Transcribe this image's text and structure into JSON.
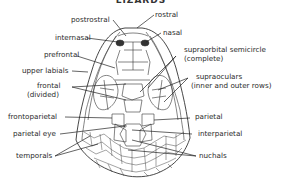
{
  "title": "LIZARDS",
  "labels": {
    "rostral": "rostral",
    "postrostral": "postrostral",
    "nasal": "nasal",
    "internasal": "internasal",
    "prefrontal": "prefrontal",
    "supraorbital": "supraorbital semicircle",
    "supraorbital_sub": "(complete)",
    "upper_labials": "upper labials",
    "supraoculars": "supraoculars",
    "supraoculars_sub": "(inner and outer rows)",
    "frontal": "frontal",
    "frontal_sub": "(divided)",
    "frontoparietal": "frontoparietal",
    "parietal": "parietal",
    "parietal_eye": "parietal eye",
    "interparietal": "interparietal",
    "temporals": "temporals",
    "nuchals": "nuchals"
  }
}
